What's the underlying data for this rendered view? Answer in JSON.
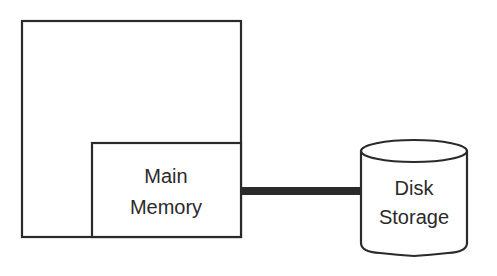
{
  "diagram": {
    "type": "block-diagram",
    "nodes": [
      {
        "id": "computer",
        "label": "",
        "shape": "rectangle"
      },
      {
        "id": "main_memory",
        "label_lines": [
          "Main",
          "Memory"
        ],
        "shape": "rectangle"
      },
      {
        "id": "disk_storage",
        "label_lines": [
          "Disk",
          "Storage"
        ],
        "shape": "cylinder"
      }
    ],
    "edges": [
      {
        "from": "main_memory",
        "to": "disk_storage",
        "style": "thick-line"
      }
    ],
    "colors": {
      "stroke": "#2a2a2a",
      "background": "#ffffff"
    }
  }
}
